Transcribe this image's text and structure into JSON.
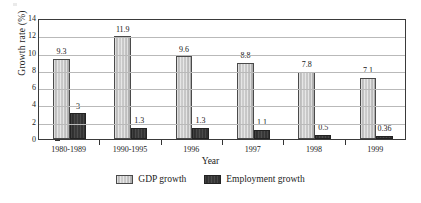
{
  "chart_data": {
    "type": "bar",
    "title": "",
    "xlabel": "Year",
    "ylabel": "Growth rate (%)",
    "categories": [
      "1980-1989",
      "1990-1995",
      "1996",
      "1997",
      "1998",
      "1999"
    ],
    "series": [
      {
        "name": "GDP growth",
        "color": "#c4c4c4",
        "values": [
          9.3,
          11.9,
          9.6,
          8.8,
          7.8,
          7.1
        ],
        "labels": [
          "9.3",
          "11.9",
          "9.6",
          "8.8",
          "7.8",
          "7.1"
        ]
      },
      {
        "name": "Employment growth",
        "color": "#333333",
        "values": [
          3,
          1.3,
          1.3,
          1.1,
          0.5,
          0.36
        ],
        "labels": [
          "3",
          "1.3",
          "1.3",
          "1.1",
          "0.5",
          "0.36"
        ]
      }
    ],
    "ylim": [
      0,
      14
    ],
    "yticks": [
      0,
      2,
      4,
      6,
      8,
      10,
      12,
      14
    ],
    "ytick_labels": [
      "0",
      "2",
      "4",
      "6",
      "8",
      "10",
      "12",
      "14"
    ],
    "grid": true,
    "grid_axis": "y",
    "legend_position": "bottom"
  }
}
